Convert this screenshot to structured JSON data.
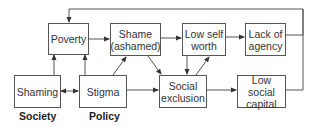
{
  "nodes": {
    "poverty": "Poverty",
    "shame_line1": "Shame",
    "shame_line2": "(ashamed)",
    "low_self_worth_line1": "Low self",
    "low_self_worth_line2": "worth",
    "lack_of_agency_line1": "Lack of",
    "lack_of_agency_line2": "agency",
    "shaming": "Shaming",
    "stigma": "Stigma",
    "social_exclusion_line1": "Social",
    "social_exclusion_line2": "exclusion",
    "low_social_capital_line1": "Low social",
    "low_social_capital_line2": "capital"
  },
  "labels": {
    "society": "Society",
    "policy": "Policy"
  },
  "edges": [
    {
      "from": "Shaming",
      "to": "Poverty"
    },
    {
      "from": "Stigma",
      "to": "Poverty"
    },
    {
      "from": "Shaming",
      "to": "Stigma",
      "bidirectional": true
    },
    {
      "from": "Poverty",
      "to": "Shame (ashamed)"
    },
    {
      "from": "Stigma",
      "to": "Shame (ashamed)"
    },
    {
      "from": "Stigma",
      "to": "Social exclusion"
    },
    {
      "from": "Shame (ashamed)",
      "to": "Social exclusion"
    },
    {
      "from": "Shame (ashamed)",
      "to": "Low self worth"
    },
    {
      "from": "Low self worth",
      "to": "Social exclusion"
    },
    {
      "from": "Social exclusion",
      "to": "Low self worth"
    },
    {
      "from": "Low self worth",
      "to": "Lack of agency"
    },
    {
      "from": "Social exclusion",
      "to": "Low social capital"
    },
    {
      "from": "Lack of agency",
      "to": "Poverty",
      "via": "feedback loop"
    },
    {
      "from": "Low social capital",
      "to": "Poverty",
      "via": "feedback loop"
    }
  ]
}
